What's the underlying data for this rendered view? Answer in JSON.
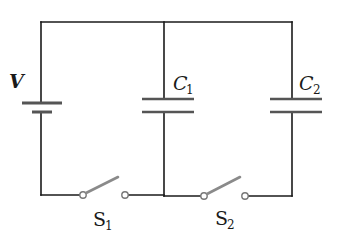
{
  "diagram": {
    "type": "circuit-schematic",
    "colors": {
      "wire": "#1a1a1a",
      "switch_blade": "#8a8a8a",
      "plate": "#555555",
      "background": "#ffffff"
    },
    "components": {
      "battery": {
        "label": "V"
      },
      "capacitor_1": {
        "label": "C",
        "subscript": "1"
      },
      "capacitor_2": {
        "label": "C",
        "subscript": "2"
      },
      "switch_1": {
        "label": "S",
        "subscript": "1",
        "state": "open"
      },
      "switch_2": {
        "label": "S",
        "subscript": "2",
        "state": "open"
      }
    }
  }
}
